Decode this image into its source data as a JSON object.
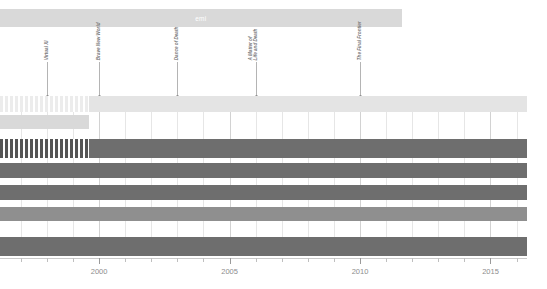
{
  "chart_data": {
    "type": "table",
    "title": "emi",
    "xlabel": "",
    "ylabel": "",
    "xlim": [
      1996.2,
      2016.4
    ],
    "grid": true,
    "legend_position": "none",
    "axis": {
      "tick_labels": [
        "2000",
        "2005",
        "2010",
        "2015"
      ],
      "tick_values": [
        2000,
        2005,
        2010,
        2015
      ],
      "minor_tick_values": [
        1997,
        1998,
        1999,
        2001,
        2002,
        2003,
        2004,
        2006,
        2007,
        2008,
        2009,
        2011,
        2012,
        2013,
        2014,
        2016
      ]
    },
    "annotations": [
      {
        "label_lines": [
          "Virtual XI"
        ],
        "year": 1998
      },
      {
        "label_lines": [
          "Brave New World"
        ],
        "year": 2000
      },
      {
        "label_lines": [
          "Dance of Death"
        ],
        "year": 2003
      },
      {
        "label_lines": [
          "A Matter of",
          "Life and Death"
        ],
        "year": 2006
      },
      {
        "label_lines": [
          "The Final Frontier"
        ],
        "year": 2010
      }
    ],
    "label_bar": {
      "text": "emi",
      "start_year": 1996.2,
      "end_year": 2011.6,
      "color": "#d9d9d9"
    },
    "series": [
      {
        "name": "row-1",
        "start_year": 1996.2,
        "end_year": 2016.4,
        "color": "#e4e4e4",
        "striped_until": 1999.6,
        "stripe_color": "#ececec"
      },
      {
        "name": "row-2",
        "start_year": 1996.2,
        "end_year": 1999.6,
        "color": "#d9d9d9",
        "striped_until": 0,
        "stripe_color": "#d9d9d9"
      },
      {
        "name": "row-3",
        "start_year": 1996.2,
        "end_year": 2016.4,
        "color": "#6e6e6e",
        "striped_until": 1999.6,
        "stripe_color": "#555555"
      },
      {
        "name": "row-4",
        "start_year": 1996.2,
        "end_year": 2016.4,
        "color": "#6e6e6e",
        "striped_until": 0,
        "stripe_color": "#6e6e6e"
      },
      {
        "name": "row-5",
        "start_year": 1996.2,
        "end_year": 2016.4,
        "color": "#6e6e6e",
        "striped_until": 0,
        "stripe_color": "#6e6e6e"
      },
      {
        "name": "row-6",
        "start_year": 1996.2,
        "end_year": 2016.4,
        "color": "#8f8f8f",
        "striped_until": 0,
        "stripe_color": "#8f8f8f"
      },
      {
        "name": "row-7",
        "start_year": 1996.2,
        "end_year": 2016.4,
        "color": "#6e6e6e",
        "striped_until": 0,
        "stripe_color": "#6e6e6e"
      }
    ],
    "colors": {
      "bar_dark": "#6e6e6e",
      "bar_mid": "#8f8f8f",
      "bar_light": "#d9d9d9",
      "bar_pale": "#e4e4e4",
      "grid": "#e6e6e6",
      "text": "#8d8d8d"
    }
  }
}
